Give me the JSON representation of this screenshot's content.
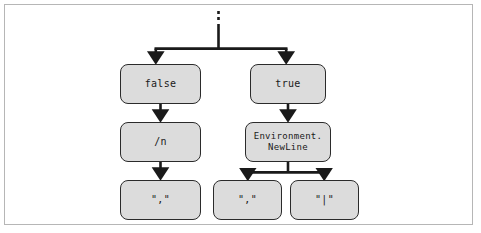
{
  "figure": {
    "kind": "syntax-flow-diagram",
    "background_color": "#ffffff",
    "border_color": "#b6b6b6",
    "node_fill_color": "#dcdcdc",
    "node_border_color": "#2b2b2b",
    "connector_color": "#1a1a1a"
  },
  "nodes": {
    "false_box": "false",
    "true_box": "true",
    "slash_n_box": "/n",
    "environment_newline_box": "Environment.\nNewLine",
    "comma_left_box": "\",\"",
    "comma_middle_box": "\",\"",
    "pipe_right_box": "\"|\""
  },
  "connectors": {
    "entry_stub": "dashed-vertical-entry",
    "top_split": "split-to-false-and-true",
    "false_to_slash_n": "arrow-down",
    "true_to_newline": "arrow-down",
    "slash_n_to_comma": "arrow-down",
    "newline_split": "split-to-comma-and-pipe"
  }
}
